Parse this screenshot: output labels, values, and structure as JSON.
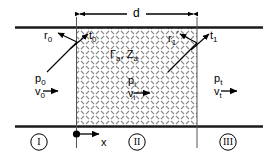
{
  "figure": {
    "dimension": {
      "label": "d",
      "description": "thickness of region II"
    },
    "regions": [
      {
        "id": "region-1",
        "label": "I"
      },
      {
        "id": "region-2",
        "label": "II"
      },
      {
        "id": "region-3",
        "label": "III"
      }
    ],
    "axis": {
      "label": "x",
      "origin_marker": "filled-dot"
    },
    "layer_properties": {
      "reflection_coefficient": "Γ",
      "reflection_subscript": "a",
      "impedance": "Z",
      "impedance_subscript": "a",
      "combined": "Γa, Za",
      "separator": ", "
    },
    "waves": {
      "incident_left": {
        "pressure": "p",
        "pressure_sub": "0",
        "velocity": "v",
        "velocity_sub": "0"
      },
      "interior": {
        "pressure": "p",
        "pressure_sub": "i",
        "velocity": "v",
        "velocity_sub": "i"
      },
      "transmitted_right": {
        "pressure": "p",
        "pressure_sub": "t",
        "velocity": "v",
        "velocity_sub": "t"
      }
    },
    "coefficients": {
      "reflected_left": {
        "symbol": "r",
        "sub": "0",
        "prime": ""
      },
      "transmitted_left": {
        "symbol": "t",
        "sub": "0",
        "prime": ""
      },
      "reflected_right": {
        "symbol": "r",
        "sub": "1",
        "prime": "′"
      },
      "transmitted_right": {
        "symbol": "t",
        "sub": "1",
        "prime": ""
      }
    },
    "colors": {
      "line": "#000000",
      "wall": "#1a1a1a",
      "hatch": "#7a7a7a",
      "background": "#ffffff"
    }
  }
}
